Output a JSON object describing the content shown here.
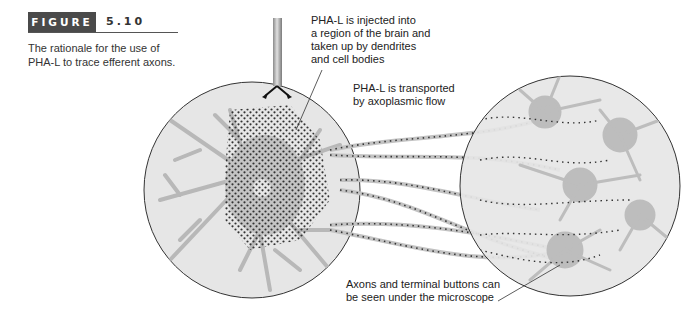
{
  "figure": {
    "label": "FIGURE",
    "number": "5.10",
    "caption_line1": "The rationale for the use of",
    "caption_line2": "PHA-L to trace efferent axons."
  },
  "callouts": {
    "injection": [
      "PHA-L is injected into",
      "a region of the brain and",
      "taken up by dendrites",
      "and cell bodies"
    ],
    "transport": [
      "PHA-L is transported",
      "by axoplasmic flow"
    ],
    "terminals": [
      "Axons and terminal buttons can",
      "be seen under the microscope"
    ]
  },
  "colors": {
    "label_bg": "#4a4a4a",
    "circle_fill": "#e6e6e6",
    "neuron": "#b5b5b5",
    "dot": "#333333"
  }
}
